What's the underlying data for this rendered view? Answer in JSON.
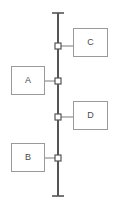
{
  "diagram": {
    "type": "bus-topology-diagram",
    "canvas": {
      "width": 115,
      "height": 205,
      "background": "#ffffff"
    },
    "colors": {
      "bus_line": "#555555",
      "box_border": "#9a9a9a",
      "box_fill": "#ffffff",
      "label_text": "#4a4a4a",
      "connector_line": "#7a7a7a",
      "node_marker_fill": "#ffffff",
      "node_marker_stroke": "#555555"
    },
    "bus": {
      "name": "vertical-bus-line",
      "x": 58,
      "y_start": 13,
      "y_end": 196,
      "stroke_width": 2,
      "terminator_top": {
        "shape": "t-cap",
        "y": 13,
        "half_width": 6
      },
      "terminator_bottom": {
        "shape": "t-cap",
        "y": 196,
        "half_width": 6
      }
    },
    "nodes": [
      {
        "id": "tap-c",
        "label": "C",
        "bus_y": 46,
        "side": "right"
      },
      {
        "id": "tap-a",
        "label": "A",
        "bus_y": 81,
        "side": "left"
      },
      {
        "id": "tap-d",
        "label": "D",
        "bus_y": 117,
        "side": "right"
      },
      {
        "id": "tap-b",
        "label": "B",
        "bus_y": 158,
        "side": "left"
      }
    ],
    "boxes": [
      {
        "id": "box-c",
        "label": "C",
        "x": 73,
        "y": 28,
        "width": 35,
        "height": 29,
        "connects_to": "tap-c",
        "connector_from_x": 58,
        "connector_to_x": 73,
        "connector_y": 46
      },
      {
        "id": "box-a",
        "label": "A",
        "x": 11,
        "y": 66,
        "width": 34,
        "height": 29,
        "connects_to": "tap-a",
        "connector_from_x": 45,
        "connector_to_x": 58,
        "connector_y": 81
      },
      {
        "id": "box-d",
        "label": "D",
        "x": 73,
        "y": 101,
        "width": 35,
        "height": 29,
        "connects_to": "tap-d",
        "connector_from_x": 58,
        "connector_to_x": 73,
        "connector_y": 117
      },
      {
        "id": "box-b",
        "label": "B",
        "x": 11,
        "y": 143,
        "width": 34,
        "height": 29,
        "connects_to": "tap-b",
        "connector_from_x": 45,
        "connector_to_x": 58,
        "connector_y": 158
      }
    ]
  }
}
